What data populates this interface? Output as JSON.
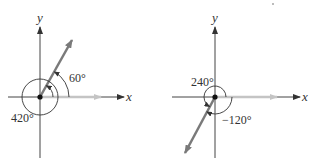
{
  "diagrams": [
    {
      "id": "left",
      "x_axis_label": "x",
      "y_axis_label": "y",
      "angle_label_small": "60°",
      "angle_label_large": "420°",
      "terminal_angle_deg": 60,
      "coterminal_angle_deg": 420
    },
    {
      "id": "right",
      "x_axis_label": "x",
      "y_axis_label": "y",
      "angle_label_positive": "240°",
      "angle_label_negative": "−120°",
      "terminal_angle_deg": 240,
      "coterminal_angle_deg": -120
    }
  ],
  "colors": {
    "axis": "#444444",
    "terminal_ray": "#7a7a7a",
    "initial_ray": "#c4c4c4",
    "arc": "#333333"
  }
}
